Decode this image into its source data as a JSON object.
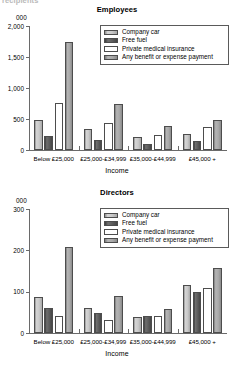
{
  "page": {
    "cut_off_heading": "recipients"
  },
  "charts": [
    {
      "key": "employees",
      "title": "Employees",
      "y_unit_label": "000",
      "xlabel": "Income",
      "ylim": [
        0,
        2000
      ],
      "yticks": [
        0,
        500,
        1000,
        1500,
        2000
      ],
      "ytick_labels": [
        "0",
        "500",
        "1,000",
        "1,500",
        "2,000"
      ],
      "legend": [
        "Company car",
        "Free fuel",
        "Private medical insurance",
        "Any benefit or expense payment"
      ],
      "categories": [
        "Below £25,000",
        "£25,000-£34,999",
        "£35,000-£44,999",
        "£45,000 +"
      ],
      "series": [
        {
          "name": "Company car",
          "values": [
            480,
            340,
            215,
            260
          ]
        },
        {
          "name": "Free fuel",
          "values": [
            230,
            165,
            100,
            145
          ]
        },
        {
          "name": "Private medical insurance",
          "values": [
            760,
            435,
            245,
            375
          ]
        },
        {
          "name": "Any benefit or expense payment",
          "values": [
            1750,
            750,
            380,
            480
          ]
        }
      ]
    },
    {
      "key": "directors",
      "title": "Directors",
      "y_unit_label": "000",
      "xlabel": "Income",
      "ylim": [
        0,
        300
      ],
      "yticks": [
        0,
        100,
        200,
        300
      ],
      "ytick_labels": [
        "0",
        "100",
        "200",
        "300"
      ],
      "legend": [
        "Company car",
        "Free fuel",
        "Private medical insurance",
        "Any benefit or expense payment"
      ],
      "categories": [
        "Below £25,000",
        "£25,000-£34,999",
        "£35,000-£44,999",
        "£45,000 +"
      ],
      "series": [
        {
          "name": "Company car",
          "values": [
            88,
            60,
            39,
            117
          ]
        },
        {
          "name": "Free fuel",
          "values": [
            60,
            49,
            40,
            100
          ]
        },
        {
          "name": "Private medical insurance",
          "values": [
            40,
            31,
            41,
            108
          ]
        },
        {
          "name": "Any benefit or expense payment",
          "values": [
            207,
            89,
            58,
            157
          ]
        }
      ]
    }
  ],
  "chart_data": {
    "type": "bar",
    "panels": [
      {
        "title": "Employees",
        "xlabel": "Income",
        "ylabel": "000",
        "ylim": [
          0,
          2000
        ],
        "yticks": [
          0,
          500,
          1000,
          1500,
          2000
        ],
        "categories": [
          "Below £25,000",
          "£25,000-£34,999",
          "£35,000-£44,999",
          "£45,000 +"
        ],
        "series": [
          {
            "name": "Company car",
            "values": [
              480,
              340,
              215,
              260
            ]
          },
          {
            "name": "Free fuel",
            "values": [
              230,
              165,
              100,
              145
            ]
          },
          {
            "name": "Private medical insurance",
            "values": [
              760,
              435,
              245,
              375
            ]
          },
          {
            "name": "Any benefit or expense payment",
            "values": [
              1750,
              750,
              380,
              480
            ]
          }
        ],
        "grid": false,
        "legend_position": "top-right"
      },
      {
        "title": "Directors",
        "xlabel": "Income",
        "ylabel": "000",
        "ylim": [
          0,
          300
        ],
        "yticks": [
          0,
          100,
          200,
          300
        ],
        "categories": [
          "Below £25,000",
          "£25,000-£34,999",
          "£35,000-£44,999",
          "£45,000 +"
        ],
        "series": [
          {
            "name": "Company car",
            "values": [
              88,
              60,
              39,
              117
            ]
          },
          {
            "name": "Free fuel",
            "values": [
              60,
              49,
              40,
              100
            ]
          },
          {
            "name": "Private medical insurance",
            "values": [
              40,
              31,
              41,
              108
            ]
          },
          {
            "name": "Any benefit or expense payment",
            "values": [
              207,
              89,
              58,
              157
            ]
          }
        ],
        "grid": false,
        "legend_position": "top-right"
      }
    ]
  }
}
